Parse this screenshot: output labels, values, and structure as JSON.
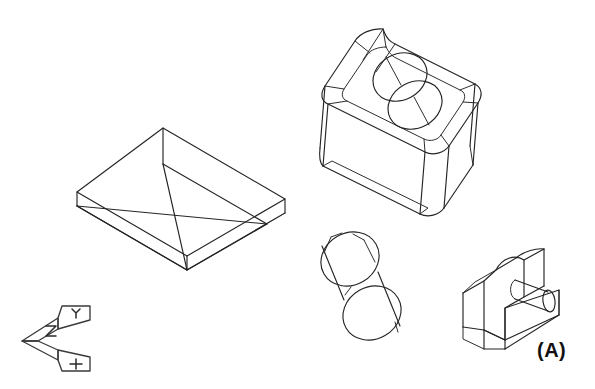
{
  "figure": {
    "label": "(A)",
    "label_position": {
      "x": 537,
      "y": 339
    },
    "background_color": "#ffffff",
    "line_color": "#242424",
    "width": 595,
    "height": 389,
    "caption_note": "Isometric pictorial drawings of four solid models with UCS icon"
  },
  "objects": [
    {
      "name": "open-box-tray",
      "description": "Open rectangular box / tray shown in isometric view, hollow with visible inner walls and floor",
      "bounds": {
        "x": 77,
        "y": 128,
        "width": 208,
        "height": 118
      }
    },
    {
      "name": "rounded-block-with-counterbore",
      "description": "Rectangular block with filleted corners, recessed pocket on top face and a counterbored through hole made of two overlapping circles",
      "bounds": {
        "x": 318,
        "y": 12,
        "width": 190,
        "height": 188
      }
    },
    {
      "name": "cylinder",
      "description": "Right circular cylinder drawn in isometric, axis tilted from upper-left to lower-right, both elliptical end faces visible",
      "bounds": {
        "x": 319,
        "y": 231,
        "width": 87,
        "height": 117
      }
    },
    {
      "name": "bracket-with-boss",
      "description": "C-shaped bracket with a flat base plate, vertical back wall with rounded top and a protruding cylindrical boss",
      "bounds": {
        "x": 463,
        "y": 249,
        "width": 96,
        "height": 100
      }
    },
    {
      "name": "ucs-axis-icon",
      "description": "Small isometric UCS coordinate axis icon with X and Y arrow labels",
      "bounds": {
        "x": 22,
        "y": 303,
        "width": 70,
        "height": 57
      }
    }
  ],
  "ucs_icon": {
    "x_label": "X",
    "y_label": "Y"
  }
}
